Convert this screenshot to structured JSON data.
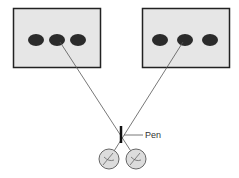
{
  "diagram": {
    "type": "convergence-experiment",
    "labels": {
      "pen": "Pen"
    },
    "panels": [
      {
        "id": "left",
        "dots": 3,
        "fixated_dot": 2
      },
      {
        "id": "right",
        "dots": 3,
        "fixated_dot": 2
      }
    ],
    "eyes": 2,
    "colors": {
      "panel_fill": "#e6e6e6",
      "panel_border": "#222222",
      "dot": "#2b2b2b",
      "sight_line": "#555555",
      "eye_fill": "#dcdcdc",
      "eye_border": "#666666",
      "pen": "#111111"
    }
  }
}
